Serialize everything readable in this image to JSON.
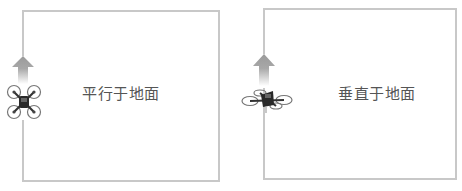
{
  "panels": [
    {
      "id": "parallel",
      "label": "平行于地面",
      "orientation": "parallel-to-ground"
    },
    {
      "id": "vertical",
      "label": "垂直于地面",
      "orientation": "perpendicular-to-ground"
    }
  ],
  "colors": {
    "frame": "#c8c8c8",
    "label": "#555555",
    "arrow": "#9a9a9a",
    "drone_body": "#333333",
    "drone_guard": "#777777"
  }
}
